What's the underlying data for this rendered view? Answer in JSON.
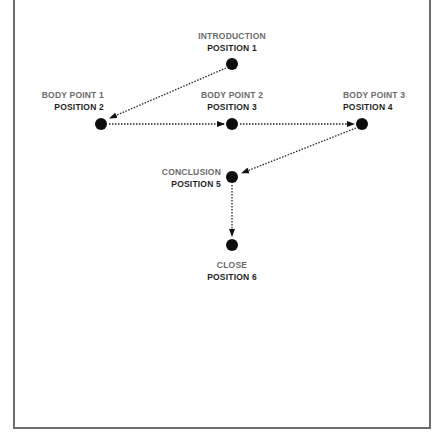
{
  "diagram": {
    "nodes": [
      {
        "id": "n1",
        "title": "INTRODUCTION",
        "position": "POSITION 1",
        "x": 232,
        "y": 64
      },
      {
        "id": "n2",
        "title": "BODY POINT 1",
        "position": "POSITION 2",
        "x": 101,
        "y": 124
      },
      {
        "id": "n3",
        "title": "BODY POINT 2",
        "position": "POSITION 3",
        "x": 232,
        "y": 124
      },
      {
        "id": "n4",
        "title": "BODY POINT 3",
        "position": "POSITION 4",
        "x": 362,
        "y": 124
      },
      {
        "id": "n5",
        "title": "CONCLUSION",
        "position": "POSITION 5",
        "x": 232,
        "y": 177
      },
      {
        "id": "n6",
        "title": "CLOSE",
        "position": "POSITION 6",
        "x": 232,
        "y": 245
      }
    ],
    "edges": [
      {
        "from": "n1",
        "to": "n2",
        "style": "dotted-arrow"
      },
      {
        "from": "n2",
        "to": "n3",
        "style": "dotted-arrow"
      },
      {
        "from": "n3",
        "to": "n4",
        "style": "dotted-arrow"
      },
      {
        "from": "n4",
        "to": "n5",
        "style": "dotted-arrow"
      },
      {
        "from": "n5",
        "to": "n6",
        "style": "dotted-arrow"
      }
    ],
    "colors": {
      "title_text": "#6b6b6b",
      "position_text": "#1f1f1f",
      "node_fill": "#0d0d0d",
      "edge": "#222222",
      "frame": "#6e6e6e"
    }
  }
}
